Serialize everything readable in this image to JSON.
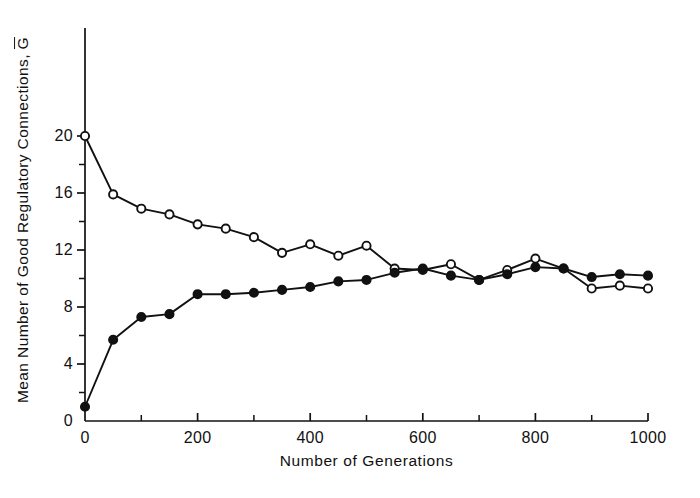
{
  "figure": {
    "background_color": "#ffffff",
    "ink_color": "#111111"
  },
  "axes": {
    "y_axis_label_main": "Mean Number of Good Regulatory Connections, ",
    "y_axis_label_symbol": "G",
    "x_axis_label": "Number of Generations",
    "y_tick_labels": [
      "0",
      "4",
      "8",
      "12",
      "16",
      "20"
    ],
    "x_tick_labels": [
      "0",
      "200",
      "400",
      "600",
      "800",
      "1000"
    ]
  },
  "chart_data": {
    "type": "line",
    "title": "",
    "xlabel": "Number of Generations",
    "ylabel": "Mean Number of Good Regulatory Connections, G-bar",
    "xlim": [
      0,
      1000
    ],
    "ylim": [
      0,
      21.5
    ],
    "xticks": [
      0,
      200,
      400,
      600,
      800,
      1000
    ],
    "yticks": [
      0,
      4,
      8,
      12,
      16,
      20
    ],
    "minor_xticks": [
      100,
      300,
      500,
      700,
      900
    ],
    "minor_yticks": [
      2,
      6,
      10,
      14,
      18
    ],
    "grid": false,
    "legend": "none",
    "x": [
      0,
      50,
      100,
      150,
      200,
      250,
      300,
      350,
      400,
      450,
      500,
      550,
      600,
      650,
      700,
      750,
      800,
      850,
      900,
      950,
      1000
    ],
    "series": [
      {
        "name": "open-circles",
        "marker": "open-circle",
        "marker_fill": "#ffffff",
        "marker_edge": "#111111",
        "line_color": "#111111",
        "values": [
          20.0,
          15.9,
          14.9,
          14.5,
          13.8,
          13.5,
          12.9,
          11.8,
          12.4,
          11.6,
          12.3,
          10.7,
          10.6,
          11.0,
          9.9,
          10.6,
          11.4,
          10.7,
          9.3,
          9.5,
          9.3
        ]
      },
      {
        "name": "filled-circles",
        "marker": "filled-circle",
        "marker_fill": "#111111",
        "marker_edge": "#111111",
        "line_color": "#111111",
        "values": [
          1.0,
          5.7,
          7.3,
          7.5,
          8.9,
          8.9,
          9.0,
          9.2,
          9.4,
          9.8,
          9.9,
          10.4,
          10.7,
          10.2,
          9.9,
          10.3,
          10.8,
          10.7,
          10.1,
          10.3,
          10.2
        ]
      }
    ]
  }
}
